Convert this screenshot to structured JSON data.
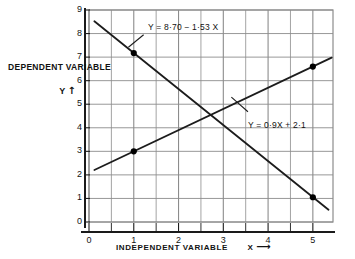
{
  "chart_data": {
    "type": "line",
    "title": "",
    "subtitle": "",
    "xlabel": "INDEPENDENT VARIABLE",
    "xlabel_symbol": "X",
    "xlabel_arrow": "⟶",
    "ylabel": "DEPENDENT VARIABLE",
    "ylabel_symbol": "Y",
    "ylabel_arrow": "↑",
    "xlim": [
      0,
      5.45
    ],
    "ylim": [
      0,
      9
    ],
    "x_ticks": [
      "0",
      "1",
      "2",
      "3",
      "4",
      "5"
    ],
    "x_tick_values": [
      0,
      1,
      2,
      3,
      4,
      5
    ],
    "x_minor_step": 0.5,
    "y_ticks": [
      "0",
      "1",
      "2",
      "3",
      "4",
      "5",
      "6",
      "7",
      "8",
      "9"
    ],
    "y_tick_values": [
      0,
      1,
      2,
      3,
      4,
      5,
      6,
      7,
      8,
      9
    ],
    "grid": true,
    "legend": "none",
    "series": [
      {
        "name": "regression-of-y-on-x",
        "equation": "Y = 8·70 − 1·53 X",
        "slope": -1.53,
        "intercept": 8.7,
        "x": [
          0.12,
          5.35
        ],
        "y": [
          8.52,
          0.52
        ],
        "points": [
          {
            "x": 1,
            "y": 7.17
          },
          {
            "x": 5,
            "y": 1.05
          }
        ],
        "marker": "filled-circle"
      },
      {
        "name": "regression-of-x-on-y",
        "equation": "Y = 0·9X + 2·1",
        "slope": 0.9,
        "intercept": 2.1,
        "x": [
          0.12,
          5.42
        ],
        "y": [
          2.21,
          6.98
        ],
        "points": [
          {
            "x": 1,
            "y": 3.0
          },
          {
            "x": 5,
            "y": 6.6
          }
        ],
        "marker": "filled-circle"
      }
    ],
    "annotations": [
      {
        "text": "Y = 8·70 − 1·53 X",
        "target_series": "regression-of-y-on-x",
        "leader_from": {
          "x": 1.22,
          "y": 7.95
        },
        "leader_to": {
          "x": 0.88,
          "y": 7.42
        }
      },
      {
        "text": "Y = 0·9X + 2·1",
        "target_series": "regression-of-x-on-y",
        "leader_from": {
          "x": 3.55,
          "y": 4.68
        },
        "leader_to": {
          "x": 3.18,
          "y": 5.3
        }
      }
    ],
    "intersection": {
      "x": 2.71,
      "y": 4.54
    },
    "colors": {
      "background": "#ffffff",
      "grid": "#8c8c8c",
      "axis": "#1a1a1a",
      "line": "#1c1c1c",
      "marker": "#000000",
      "text": "#111111"
    }
  }
}
